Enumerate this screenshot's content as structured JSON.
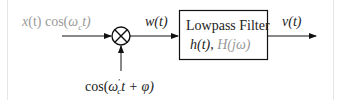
{
  "diagram": {
    "input_label": "x(t) cos(ω_c t)",
    "input_label_parts": {
      "x": "x",
      "t1": "(t) cos(",
      "omega": "ω",
      "sub": "c",
      "t2": "t)"
    },
    "multiplier_symbol": "⊗",
    "mixer_label": "cos(ω′_c t + φ)",
    "mixer_label_parts": {
      "pre": "cos(",
      "omega": "ω",
      "prime": "′",
      "sub": "c",
      "post": "t + φ)"
    },
    "intermediate_label": "w(t)",
    "filter_block": {
      "title": "Lowpass Filter",
      "impulse_response": "h(t),",
      "frequency_response": "H(jω)"
    },
    "output_label": "v(t)",
    "colors": {
      "line": "#111111",
      "text": "#222222",
      "muted_text": "#999999",
      "frame": "#e6e6e6"
    }
  }
}
